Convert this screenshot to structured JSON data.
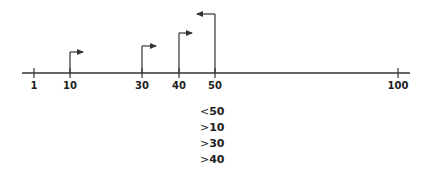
{
  "diagram": {
    "type": "number-line-intervals",
    "axis": {
      "x_start": 22,
      "x_end": 410,
      "y": 73,
      "color": "#333333"
    },
    "ticks": [
      {
        "label": "1",
        "x": 34
      },
      {
        "label": "10",
        "x": 70
      },
      {
        "label": "30",
        "x": 142
      },
      {
        "label": "40",
        "x": 179
      },
      {
        "label": "50",
        "x": 215
      },
      {
        "label": "100",
        "x": 398
      }
    ],
    "arrows": [
      {
        "from_value": "10",
        "x": 70,
        "top_y": 52,
        "direction": "right",
        "end_x": 83
      },
      {
        "from_value": "30",
        "x": 142,
        "top_y": 46,
        "direction": "right",
        "end_x": 156
      },
      {
        "from_value": "40",
        "x": 179,
        "top_y": 33,
        "direction": "right",
        "end_x": 192
      },
      {
        "from_value": "50",
        "x": 215,
        "top_y": 14,
        "direction": "left",
        "end_x": 197
      }
    ],
    "conditions": [
      {
        "op": "<",
        "value": "50"
      },
      {
        "op": ">",
        "value": "10"
      },
      {
        "op": ">",
        "value": "30"
      },
      {
        "op": ">",
        "value": "40"
      }
    ]
  }
}
